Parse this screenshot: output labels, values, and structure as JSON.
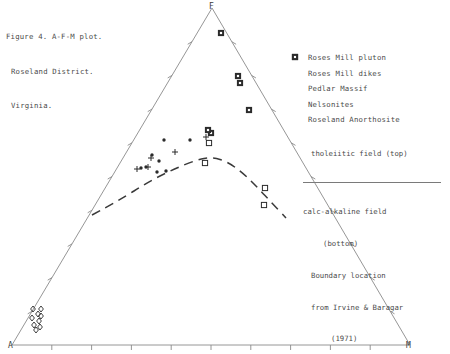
{
  "caption": {
    "line1": "Figure 4. A-F-M plot.",
    "line2": "Roseland District.",
    "line3": "Virginia."
  },
  "legend": {
    "items": [
      {
        "symbol": "dot",
        "label": "Roses Mill pluton"
      },
      {
        "symbol": "square",
        "label": "Roses Mill dikes"
      },
      {
        "symbol": "plus",
        "label": "Pedlar Massif"
      },
      {
        "symbol": "filled",
        "label": "Nelsonites"
      },
      {
        "symbol": "diamond",
        "label": "Roseland Anorthosite"
      }
    ]
  },
  "note": {
    "top_field": "tholeiitic field (top)",
    "bottom_field": "calc-alkaline field",
    "bottom_field2": "(bottom)",
    "source1": "Boundary location",
    "source2": "from Irvine & Baragar",
    "source3": "(1971)"
  },
  "chart_data": {
    "type": "scatter",
    "title": "Figure 4. A-F-M plot. Roseland District. Virginia.",
    "plot_kind": "ternary",
    "vertices": [
      {
        "label": "A",
        "x": 12,
        "y": 345
      },
      {
        "label": "F",
        "x": 212,
        "y": 8
      },
      {
        "label": "M",
        "x": 410,
        "y": 345
      }
    ],
    "axis_label_A": "A",
    "axis_label_F": "F",
    "axis_label_M": "M",
    "ticks_per_edge": 9,
    "grid": false,
    "legend_position": "right",
    "annotation_curve": "calc-alkaline / tholeiitic boundary (Irvine & Baragar 1971), dashed",
    "series": [
      {
        "name": "Roses Mill pluton",
        "symbol": "dot",
        "points": [
          [
            164,
            140
          ],
          [
            190,
            140
          ],
          [
            152,
            155
          ],
          [
            146,
            167
          ],
          [
            141,
            168
          ],
          [
            159,
            161
          ],
          [
            166,
            171
          ],
          [
            157,
            172
          ]
        ]
      },
      {
        "name": "Roses Mill dikes",
        "symbol": "square",
        "points": [
          [
            209,
            143
          ],
          [
            205,
            163
          ],
          [
            265,
            188
          ],
          [
            264,
            205
          ]
        ]
      },
      {
        "name": "Pedlar Massif",
        "symbol": "plus",
        "points": [
          [
            175,
            152
          ],
          [
            151,
            158
          ],
          [
            148,
            167
          ],
          [
            137,
            169
          ],
          [
            206,
            137
          ]
        ]
      },
      {
        "name": "Nelsonites",
        "symbol": "filled",
        "points": [
          [
            221,
            33
          ],
          [
            238,
            76
          ],
          [
            240,
            83
          ],
          [
            249,
            110
          ],
          [
            211,
            133
          ],
          [
            208,
            130
          ]
        ]
      },
      {
        "name": "Roseland Anorthosite",
        "symbol": "diamond",
        "points": [
          [
            33,
            309
          ],
          [
            41,
            309
          ],
          [
            38,
            314
          ],
          [
            32,
            318
          ],
          [
            41,
            316
          ],
          [
            39,
            321
          ],
          [
            34,
            325
          ],
          [
            40,
            327
          ],
          [
            36,
            330
          ]
        ]
      }
    ],
    "boundary_curve": [
      [
        92,
        215
      ],
      [
        120,
        200
      ],
      [
        148,
        182
      ],
      [
        172,
        170
      ],
      [
        196,
        160
      ],
      [
        212,
        157
      ],
      [
        228,
        162
      ],
      [
        244,
        174
      ],
      [
        258,
        188
      ],
      [
        272,
        203
      ],
      [
        286,
        218
      ]
    ]
  },
  "colors": {
    "line": "#8a8a8a",
    "text": "#4a4a4a",
    "marker": "#2b2b2b"
  }
}
